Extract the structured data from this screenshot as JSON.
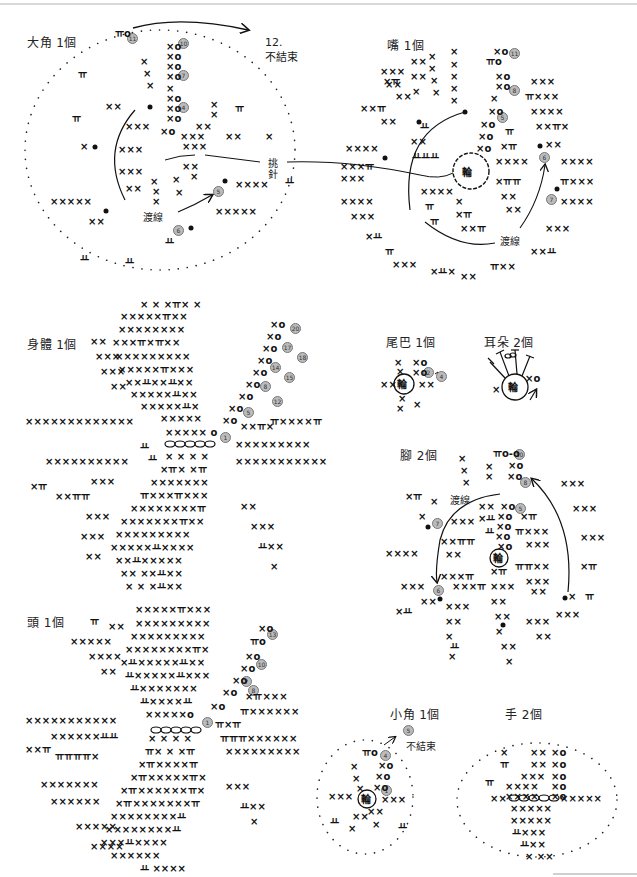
{
  "diagrams": [
    {
      "id": "big-horn",
      "title": "大角 1個",
      "notes": [
        "12.",
        "不結束",
        "挑",
        "針",
        "渡線"
      ],
      "rounds": [
        "11",
        "10",
        "7",
        "4",
        "5",
        "6"
      ]
    },
    {
      "id": "mouth",
      "title": "嘴 1個",
      "notes": [
        "渡線",
        "輪"
      ],
      "rounds": [
        "11",
        "8",
        "5",
        "6",
        "7"
      ]
    },
    {
      "id": "body",
      "title": "身體 1個",
      "rounds": [
        "20",
        "17",
        "18",
        "14",
        "15",
        "8",
        "12",
        "5",
        "1"
      ]
    },
    {
      "id": "tail",
      "title": "尾巴 1個",
      "notes": [
        "輪"
      ],
      "rounds": [
        "2",
        "4"
      ]
    },
    {
      "id": "ear",
      "title": "耳朵 2個",
      "notes": [
        "輪"
      ]
    },
    {
      "id": "foot",
      "title": "腳 2個",
      "notes": [
        "渡線",
        "輪"
      ],
      "rounds": [
        "10",
        "8",
        "5",
        "7",
        "6"
      ]
    },
    {
      "id": "head",
      "title": "頭 1個",
      "rounds": [
        "13",
        "10",
        "7",
        "8",
        "1"
      ]
    },
    {
      "id": "small-horn",
      "title": "小角 1個",
      "notes": [
        "不結束",
        "輪"
      ],
      "rounds": [
        "5",
        "4",
        "1"
      ]
    },
    {
      "id": "hand",
      "title": "手 2個"
    }
  ],
  "labels": {
    "big_horn_title": "大角 1個",
    "big_horn_round12": "12.",
    "big_horn_no_finish": "不結束",
    "pick_stitch_1": "挑",
    "pick_stitch_2": "針",
    "big_horn_carry": "渡線",
    "mouth_title": "嘴 1個",
    "mouth_carry": "渡線",
    "body_title": "身體 1個",
    "tail_title": "尾巴 1個",
    "ear_title": "耳朵 2個",
    "foot_title": "腳 2個",
    "foot_carry": "渡線",
    "head_title": "頭 1個",
    "small_horn_title": "小角 1個",
    "small_horn_no_finish": "不結束",
    "hand_title": "手 2個"
  },
  "round_markers": {
    "bh11": "11",
    "bh10": "10",
    "bh7": "7",
    "bh4": "4",
    "bh5": "5",
    "bh6": "6",
    "m11": "11",
    "m8": "8",
    "m5": "5",
    "m6": "6",
    "m7": "7",
    "b20": "20",
    "b17": "17",
    "b18": "18",
    "b14": "14",
    "b15": "15",
    "b8": "8",
    "b12": "12",
    "b5": "5",
    "b1": "1",
    "t2": "2",
    "t4": "4",
    "f10": "10",
    "f8": "8",
    "f5": "5",
    "f7": "7",
    "f6": "6",
    "h13": "13",
    "h10": "10",
    "h7": "7",
    "h8": "8",
    "h1": "1",
    "s5": "5",
    "s4": "4",
    "s1": "1"
  },
  "symbols": {
    "sc": "×",
    "chain": "o",
    "ring": "輪",
    "inc": "ㅠ"
  }
}
